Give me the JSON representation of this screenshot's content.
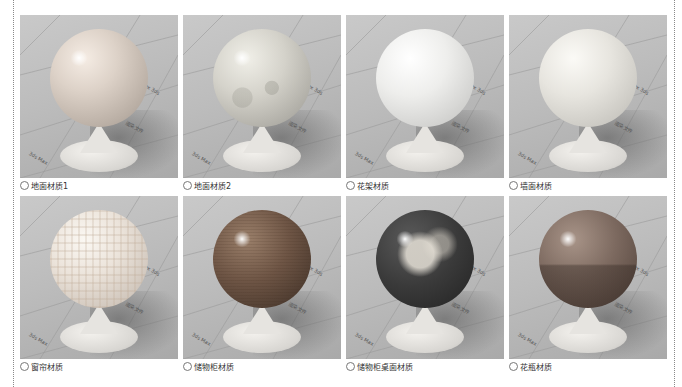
{
  "figure": {
    "caption_marker": "◎",
    "floor_texts": [
      "3ds Max",
      "Max 3ds",
      "渲染文件",
      "3ds Max"
    ],
    "items": [
      {
        "label": "地面材质1",
        "material": "floor1"
      },
      {
        "label": "地面材质2",
        "material": "floor2"
      },
      {
        "label": "花架材质",
        "material": "rack"
      },
      {
        "label": "墙面材质",
        "material": "wall"
      },
      {
        "label": "窗帘材质",
        "material": "curtain"
      },
      {
        "label": "储物柜材质",
        "material": "cabinet"
      },
      {
        "label": "储物柜桌面材质",
        "material": "table"
      },
      {
        "label": "花瓶材质",
        "material": "vase"
      }
    ]
  }
}
